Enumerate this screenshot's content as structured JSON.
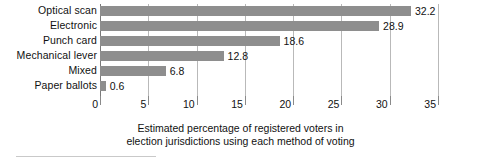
{
  "chart_data": {
    "type": "bar",
    "orientation": "horizontal",
    "title": "",
    "xlabel": "Estimated percentage of registered voters in election jurisdictions using each method of voting",
    "ylabel": "",
    "categories": [
      "Optical scan",
      "Electronic",
      "Punch card",
      "Mechanical lever",
      "Mixed",
      "Paper ballots"
    ],
    "values": [
      32.2,
      28.9,
      18.6,
      12.8,
      6.8,
      0.6
    ],
    "value_labels": [
      "32.2",
      "28.9",
      "18.6",
      "12.8",
      "6.8",
      "0.6"
    ],
    "xlim": [
      0,
      35
    ],
    "xticks": [
      0,
      5,
      10,
      15,
      20,
      25,
      30,
      35
    ],
    "xtick_labels": [
      "0",
      "5",
      "10",
      "15",
      "20",
      "25",
      "30",
      "35"
    ],
    "grid": true,
    "legend": false,
    "bar_color": "#8e8e8e",
    "gridline_color": "#b9b9b9",
    "axis_color": "#7a7a7a",
    "text_color": "#111111"
  },
  "caption": {
    "line1": "Estimated percentage of registered voters in",
    "line2": "election jurisdictions using each method of voting"
  }
}
